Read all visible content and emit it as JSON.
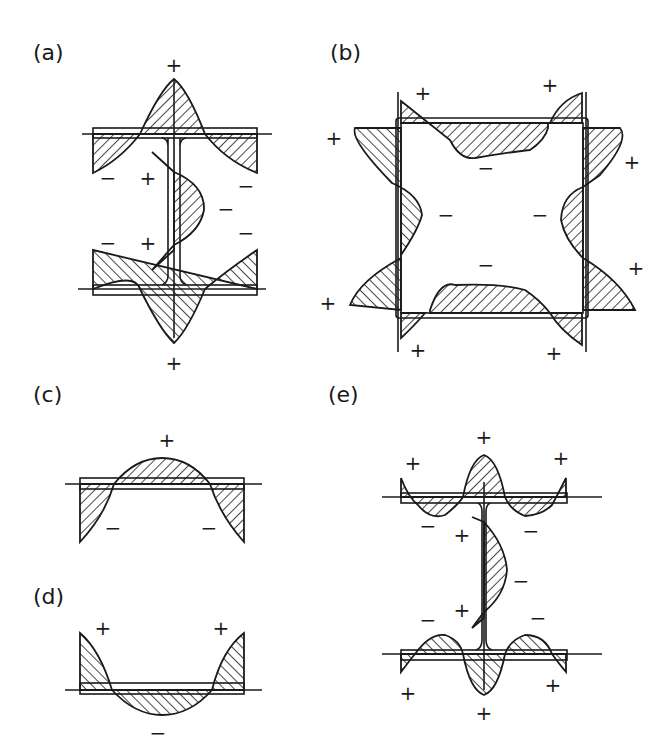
{
  "figure": {
    "panels": [
      {
        "id": "a",
        "label": "(a)",
        "shape": "I-section (welded)",
        "signs": [
          "+",
          "−",
          "+",
          "−",
          "−",
          "−",
          "+",
          "−",
          "+"
        ]
      },
      {
        "id": "b",
        "label": "(b)",
        "shape": "box section",
        "signs": [
          "+",
          "+",
          "+",
          "+",
          "−",
          "−",
          "−",
          "−",
          "+",
          "+",
          "+",
          "+"
        ]
      },
      {
        "id": "c",
        "label": "(c)",
        "shape": "plate (edge-cut)",
        "signs": [
          "+",
          "−",
          "−"
        ]
      },
      {
        "id": "d",
        "label": "(d)",
        "shape": "plate (center-welded)",
        "signs": [
          "+",
          "+",
          "−"
        ]
      },
      {
        "id": "e",
        "label": "(e)",
        "shape": "I-section (rolled)",
        "signs": [
          "+",
          "+",
          "+",
          "−",
          "+",
          "−",
          "−",
          "+",
          "−",
          "−",
          "+",
          "+",
          "+"
        ]
      }
    ],
    "colors": {
      "ink": "#1a1a1a",
      "background": "#ffffff"
    }
  },
  "labels": {
    "a": "(a)",
    "b": "(b)",
    "c": "(c)",
    "d": "(d)",
    "e": "(e)"
  },
  "signs": {
    "plus": "+",
    "minus": "−"
  }
}
